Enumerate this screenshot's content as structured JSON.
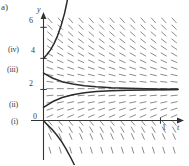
{
  "figure": {
    "panel_label": "a)",
    "axis_labels": {
      "y": "y",
      "t": "t"
    },
    "y_ticks": [
      "6",
      "4",
      "2",
      "0"
    ],
    "t_ticks": [
      "1"
    ],
    "curve_labels": [
      "(iv)",
      "(iii)",
      "(ii)",
      "(i)"
    ],
    "colors": {
      "axis": "#333333",
      "curve": "#2a2a2a",
      "slope_mark": "#8c8c8c",
      "background": "#ffffff",
      "text": "#3a3a3a"
    }
  },
  "chart_data": {
    "type": "line",
    "title": "",
    "xlabel": "t",
    "ylabel": "y",
    "xlim": [
      0,
      1.15
    ],
    "ylim": [
      -1.5,
      6.6
    ],
    "grid": false,
    "legend": "none",
    "equilibrium": 2,
    "y_tick_values": [
      0,
      2,
      4,
      6
    ],
    "x_tick_values": [
      1
    ],
    "annotations": [
      {
        "text": "(iv)",
        "y": 4
      },
      {
        "text": "(iii)",
        "y": 3
      },
      {
        "text": "(ii)",
        "y": 1
      },
      {
        "text": "(i)",
        "y": 0
      }
    ],
    "series": [
      {
        "name": "(iv)",
        "initial_value": 4,
        "x": [
          0.0,
          0.03,
          0.06,
          0.09,
          0.12,
          0.15,
          0.18,
          0.2,
          0.215,
          0.225
        ],
        "values": [
          4.0,
          4.25,
          4.55,
          4.95,
          5.45,
          6.1,
          6.9,
          7.6,
          8.2,
          8.8
        ]
      },
      {
        "name": "(iii)",
        "initial_value": 3.05,
        "x": [
          0.0,
          0.08,
          0.16,
          0.25,
          0.35,
          0.45,
          0.58,
          0.72,
          0.88,
          1.05,
          1.15
        ],
        "values": [
          3.05,
          2.72,
          2.5,
          2.35,
          2.24,
          2.17,
          2.11,
          2.07,
          2.04,
          2.02,
          2.01
        ]
      },
      {
        "name": "(ii)",
        "initial_value": 0.85,
        "x": [
          0.0,
          0.08,
          0.16,
          0.25,
          0.35,
          0.45,
          0.58,
          0.72,
          0.88,
          1.05,
          1.15
        ],
        "values": [
          0.85,
          1.22,
          1.48,
          1.66,
          1.79,
          1.86,
          1.92,
          1.95,
          1.97,
          1.985,
          1.99
        ]
      },
      {
        "name": "(i)",
        "initial_value": 0.0,
        "x": [
          0.0,
          0.03,
          0.07,
          0.11,
          0.15,
          0.19,
          0.23,
          0.26,
          0.285,
          0.3
        ],
        "values": [
          0.0,
          -0.25,
          -0.55,
          -0.9,
          -1.3,
          -1.8,
          -2.35,
          -2.8,
          -3.2,
          -3.5
        ]
      }
    ]
  }
}
